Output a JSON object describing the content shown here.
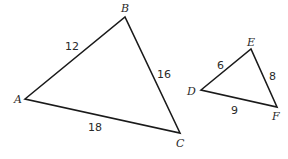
{
  "diagram": {
    "triangles": [
      {
        "name": "ABC",
        "vertices": [
          {
            "label": "A",
            "x": 25,
            "y": 99,
            "lx": 14,
            "ly": 103
          },
          {
            "label": "B",
            "x": 125,
            "y": 17,
            "lx": 121,
            "ly": 12
          },
          {
            "label": "C",
            "x": 180,
            "y": 133,
            "lx": 176,
            "ly": 147
          }
        ],
        "sides": [
          {
            "label": "12",
            "x": 65,
            "y": 50
          },
          {
            "label": "16",
            "x": 157,
            "y": 78
          },
          {
            "label": "18",
            "x": 88,
            "y": 131
          }
        ]
      },
      {
        "name": "DEF",
        "vertices": [
          {
            "label": "D",
            "x": 201,
            "y": 90,
            "lx": 187,
            "ly": 95
          },
          {
            "label": "E",
            "x": 251,
            "y": 49,
            "lx": 247,
            "ly": 46
          },
          {
            "label": "F",
            "x": 277,
            "y": 107,
            "lx": 272,
            "ly": 120
          }
        ],
        "sides": [
          {
            "label": "6",
            "x": 217,
            "y": 69
          },
          {
            "label": "8",
            "x": 269,
            "y": 80
          },
          {
            "label": "9",
            "x": 231,
            "y": 114
          }
        ]
      }
    ]
  }
}
